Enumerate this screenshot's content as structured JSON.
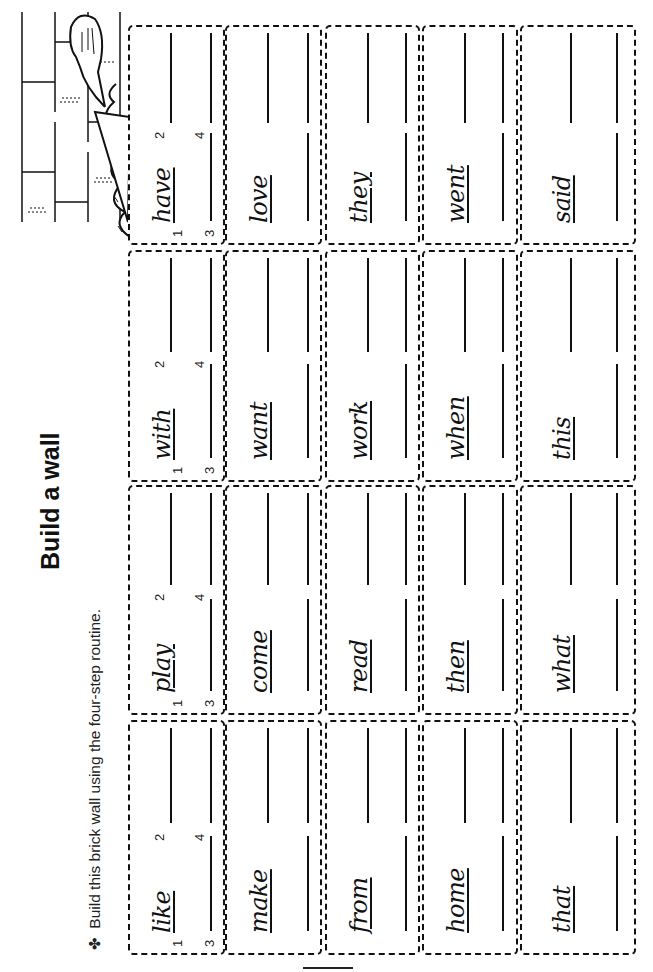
{
  "page": {
    "title": "Build a wall",
    "instruction_bullet": "✤",
    "instruction": "Build this brick wall using the four-step routine."
  },
  "step_numbers": {
    "n1": "1",
    "n2": "2",
    "n3": "3",
    "n4": "4"
  },
  "wall": {
    "rows": [
      {
        "bricks": [
          {
            "word": "like"
          },
          {
            "word": "play"
          },
          {
            "word": "with"
          },
          {
            "word": "have"
          }
        ]
      },
      {
        "bricks": [
          {
            "word": "make"
          },
          {
            "word": "come"
          },
          {
            "word": "want"
          },
          {
            "word": "love"
          }
        ]
      },
      {
        "bricks": [
          {
            "word": "from"
          },
          {
            "word": "read"
          },
          {
            "word": "work"
          },
          {
            "word": "they"
          }
        ]
      },
      {
        "bricks": [
          {
            "word": "home"
          },
          {
            "word": "then"
          },
          {
            "word": "when"
          },
          {
            "word": "went"
          }
        ]
      },
      {
        "bricks": [
          {
            "word": "that"
          },
          {
            "word": "what"
          },
          {
            "word": "this"
          },
          {
            "word": "said"
          }
        ]
      }
    ]
  },
  "illustration": {
    "icon": "trowel-icon",
    "description": "trowel with mortar on brick wall"
  },
  "colors": {
    "ink": "#111111",
    "paper": "#ffffff"
  }
}
